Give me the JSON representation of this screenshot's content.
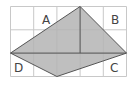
{
  "diagram": {
    "grid": {
      "cols": 5,
      "rows": 3,
      "origin": [
        10.5,
        6.5
      ],
      "cell": 23.2,
      "line_color": "#c8c8c8"
    },
    "shape": {
      "vertices": {
        "top": [
          3,
          0
        ],
        "right": [
          5,
          2
        ],
        "bottom": [
          2,
          3
        ],
        "left": [
          0,
          2
        ]
      },
      "fill": "#b4b4b4",
      "stroke": "#555555"
    },
    "diagonals": [
      {
        "from": [
          0,
          2
        ],
        "to": [
          5,
          2
        ]
      },
      {
        "from": [
          3,
          0
        ],
        "to": [
          3,
          2
        ]
      }
    ],
    "labels": [
      {
        "text": "A",
        "x": 47,
        "y": 24
      },
      {
        "text": "B",
        "x": 116,
        "y": 24
      },
      {
        "text": "D",
        "x": 18,
        "y": 72
      },
      {
        "text": "C",
        "x": 114,
        "y": 72
      }
    ]
  }
}
